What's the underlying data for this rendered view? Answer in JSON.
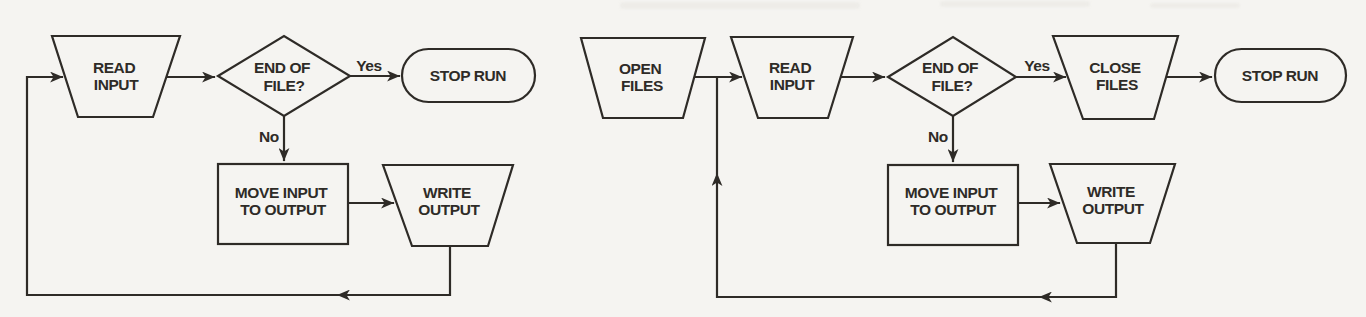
{
  "colors": {
    "background": "#f5f4f1",
    "ink": "#2e2b27"
  },
  "left_chart": {
    "nodes": {
      "read_input": {
        "l1": "READ",
        "l2": "INPUT"
      },
      "end_of_file": {
        "l1": "END OF",
        "l2": "FILE?"
      },
      "stop_run": {
        "l1": "STOP RUN"
      },
      "move_input": {
        "l1": "MOVE INPUT",
        "l2": "TO OUTPUT"
      },
      "write_output": {
        "l1": "WRITE",
        "l2": "OUTPUT"
      }
    },
    "branch_labels": {
      "yes": "Yes",
      "no": "No"
    },
    "connections": [
      {
        "from": "read_input",
        "to": "end_of_file"
      },
      {
        "from": "end_of_file",
        "to": "stop_run",
        "label": "Yes"
      },
      {
        "from": "end_of_file",
        "to": "move_input",
        "label": "No"
      },
      {
        "from": "move_input",
        "to": "write_output"
      },
      {
        "from": "write_output",
        "to": "read_input",
        "type": "loop-back"
      }
    ]
  },
  "right_chart": {
    "nodes": {
      "open_files": {
        "l1": "OPEN",
        "l2": "FILES"
      },
      "read_input": {
        "l1": "READ",
        "l2": "INPUT"
      },
      "end_of_file": {
        "l1": "END OF",
        "l2": "FILE?"
      },
      "close_files": {
        "l1": "CLOSE",
        "l2": "FILES"
      },
      "stop_run": {
        "l1": "STOP RUN"
      },
      "move_input": {
        "l1": "MOVE INPUT",
        "l2": "TO OUTPUT"
      },
      "write_output": {
        "l1": "WRITE",
        "l2": "OUTPUT"
      }
    },
    "branch_labels": {
      "yes": "Yes",
      "no": "No"
    },
    "connections": [
      {
        "from": "open_files",
        "to": "read_input"
      },
      {
        "from": "read_input",
        "to": "end_of_file"
      },
      {
        "from": "end_of_file",
        "to": "close_files",
        "label": "Yes"
      },
      {
        "from": "close_files",
        "to": "stop_run"
      },
      {
        "from": "end_of_file",
        "to": "move_input",
        "label": "No"
      },
      {
        "from": "move_input",
        "to": "write_output"
      },
      {
        "from": "write_output",
        "to": "read_input",
        "type": "loop-back joins open_files-to-read_input connector"
      }
    ]
  }
}
